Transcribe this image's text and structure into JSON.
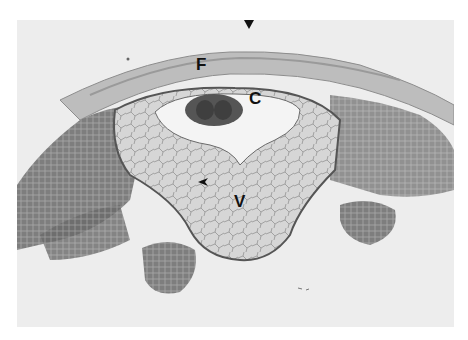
{
  "figure": {
    "type": "histology micrograph",
    "labels": [
      {
        "id": "F",
        "text": "F",
        "x": 196,
        "y": 53
      },
      {
        "id": "C",
        "text": "C",
        "x": 249,
        "y": 88
      },
      {
        "id": "V",
        "text": "V",
        "x": 234,
        "y": 191
      }
    ],
    "annotations": [
      {
        "type": "arrow-down",
        "x": 248,
        "y": 37
      },
      {
        "type": "arrowhead",
        "x": 203,
        "y": 181
      }
    ]
  }
}
